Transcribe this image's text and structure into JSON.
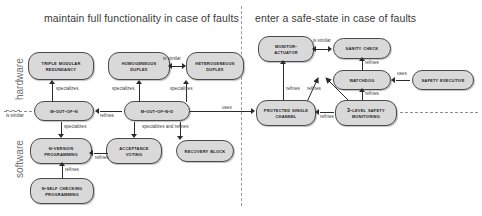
{
  "diagram": {
    "headers": [
      {
        "text": "maintain full functionality in case of faults"
      },
      {
        "text": "enter a safe-state in case of faults"
      }
    ],
    "layer_labels": [
      {
        "text": "hardware"
      },
      {
        "text": "software"
      }
    ],
    "nodes": [
      {
        "id": "tmr",
        "line1": "Triple Modular",
        "line2": "Redundancy"
      },
      {
        "id": "homo",
        "line1": "Homogeneous",
        "line2": "Duplex"
      },
      {
        "id": "hetero",
        "line1": "Heterogeneous",
        "line2": "Duplex"
      },
      {
        "id": "moutn",
        "line1": "M-out-of-N",
        "line2": ""
      },
      {
        "id": "moutnd",
        "line1": "M-out-of-N-D",
        "line2": ""
      },
      {
        "id": "nvp",
        "line1": "N-Version",
        "line2": "Programming"
      },
      {
        "id": "av",
        "line1": "Acceptance",
        "line2": "Voting"
      },
      {
        "id": "rb",
        "line1": "Recovery Block",
        "line2": ""
      },
      {
        "id": "nscp",
        "line1": "N-Self Checking",
        "line2": "Programming"
      },
      {
        "id": "ma",
        "line1": "Monitor-",
        "line2": "Actuator"
      },
      {
        "id": "sc",
        "line1": "Sanity Check",
        "line2": ""
      },
      {
        "id": "wd",
        "line1": "Watchdog",
        "line2": ""
      },
      {
        "id": "se",
        "line1": "Safety Executive",
        "line2": ""
      },
      {
        "id": "psc",
        "line1": "Protected Single",
        "line2": "Channel"
      },
      {
        "id": "slsm",
        "line1": "3-Level Safety",
        "line2": "Monitoring"
      }
    ],
    "edge_labels": [
      {
        "id": "el1",
        "text": "specializes"
      },
      {
        "id": "el2",
        "text": "is similar"
      },
      {
        "id": "el3",
        "text": "specializes"
      },
      {
        "id": "el4",
        "text": "specializes"
      },
      {
        "id": "el5",
        "text": "is similar"
      },
      {
        "id": "el6",
        "text": "refines"
      },
      {
        "id": "el7",
        "text": "uses"
      },
      {
        "id": "el8",
        "text": "specializes"
      },
      {
        "id": "el9",
        "text": "specializes and refines"
      },
      {
        "id": "el10",
        "text": "refines"
      },
      {
        "id": "el11",
        "text": "refines"
      },
      {
        "id": "el12",
        "text": "is similar"
      },
      {
        "id": "el13",
        "text": "refines"
      },
      {
        "id": "el14",
        "text": "uses"
      },
      {
        "id": "el15",
        "text": "refines"
      },
      {
        "id": "el16",
        "text": "refines"
      },
      {
        "id": "el17",
        "text": "refines"
      },
      {
        "id": "el18",
        "text": "refines"
      }
    ],
    "colors": {
      "node_fill": "#d9d9d9",
      "node_stroke": "#4a4a4a",
      "edge": "#2b2b2b",
      "header_text": "#3a3a3a",
      "divider": "#9a9a9a",
      "background": "#ffffff"
    }
  }
}
